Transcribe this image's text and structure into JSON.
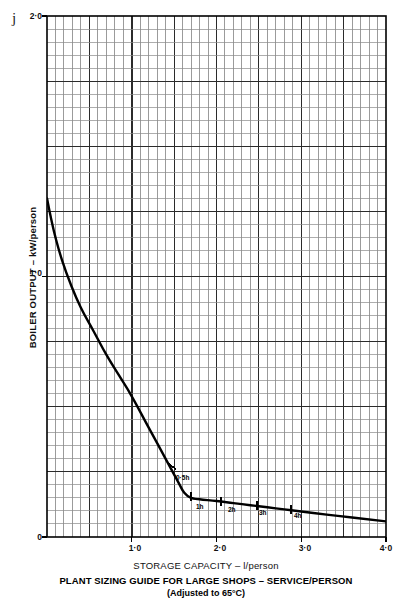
{
  "corner_mark": "j",
  "axes": {
    "ylabel": "BOILER OUTPUT – kW/person",
    "xlabel": "STORAGE CAPACITY – l/person",
    "yticks": [
      "0",
      "1·0",
      "2·0"
    ],
    "xticks": [
      "1·0",
      "2·0",
      "3·0",
      "4·0"
    ]
  },
  "titles": {
    "main": "PLANT SIZING GUIDE FOR LARGE SHOPS – SERVICE/PERSON",
    "sub": "(Adjusted to 65°C)"
  },
  "annotations": {
    "a0": "0·5h",
    "a1": "1h",
    "a2": "2h",
    "a3": "3h",
    "a4": "4h"
  },
  "colors": {
    "curve": "#000000",
    "grid_major": "#2b2b2b",
    "grid_minor": "#8a8a8a",
    "frame": "#000000",
    "text": "#111111",
    "background": "#ffffff"
  },
  "chart_data": {
    "type": "line",
    "title": "PLANT SIZING GUIDE FOR LARGE SHOPS – SERVICE/PERSON",
    "subtitle": "(Adjusted to 65°C)",
    "xlabel": "STORAGE CAPACITY – l/person",
    "ylabel": "BOILER OUTPUT – kW/person",
    "xlim": [
      0,
      4.0
    ],
    "ylim": [
      0,
      2.0
    ],
    "xticks": [
      1.0,
      2.0,
      3.0,
      4.0
    ],
    "yticks": [
      0,
      1.0,
      2.0
    ],
    "grid": true,
    "grid_style": "engineering graph paper, minor divisions",
    "legend": "none",
    "series": [
      {
        "name": "Boiler output vs storage capacity",
        "x": [
          0.0,
          0.05,
          0.1,
          0.18,
          0.28,
          0.4,
          0.55,
          0.7,
          0.85,
          1.0,
          1.2,
          1.4,
          1.55,
          1.62,
          1.7,
          1.8,
          2.0,
          2.2,
          2.4,
          2.6,
          2.8,
          3.0,
          3.3,
          3.6,
          4.0
        ],
        "y": [
          1.3,
          1.22,
          1.15,
          1.06,
          0.97,
          0.88,
          0.79,
          0.7,
          0.62,
          0.54,
          0.42,
          0.3,
          0.21,
          0.17,
          0.15,
          0.145,
          0.138,
          0.13,
          0.122,
          0.114,
          0.106,
          0.098,
          0.086,
          0.075,
          0.06
        ]
      }
    ],
    "annotations": [
      {
        "label": "0·5h",
        "x": 1.48,
        "y": 0.27,
        "marker": "tick"
      },
      {
        "label": "1h",
        "x": 1.7,
        "y": 0.155,
        "marker": "tick"
      },
      {
        "label": "2h",
        "x": 2.05,
        "y": 0.136,
        "marker": "tick"
      },
      {
        "label": "3h",
        "x": 2.48,
        "y": 0.12,
        "marker": "tick"
      },
      {
        "label": "4h",
        "x": 2.88,
        "y": 0.104,
        "marker": "tick"
      }
    ]
  }
}
